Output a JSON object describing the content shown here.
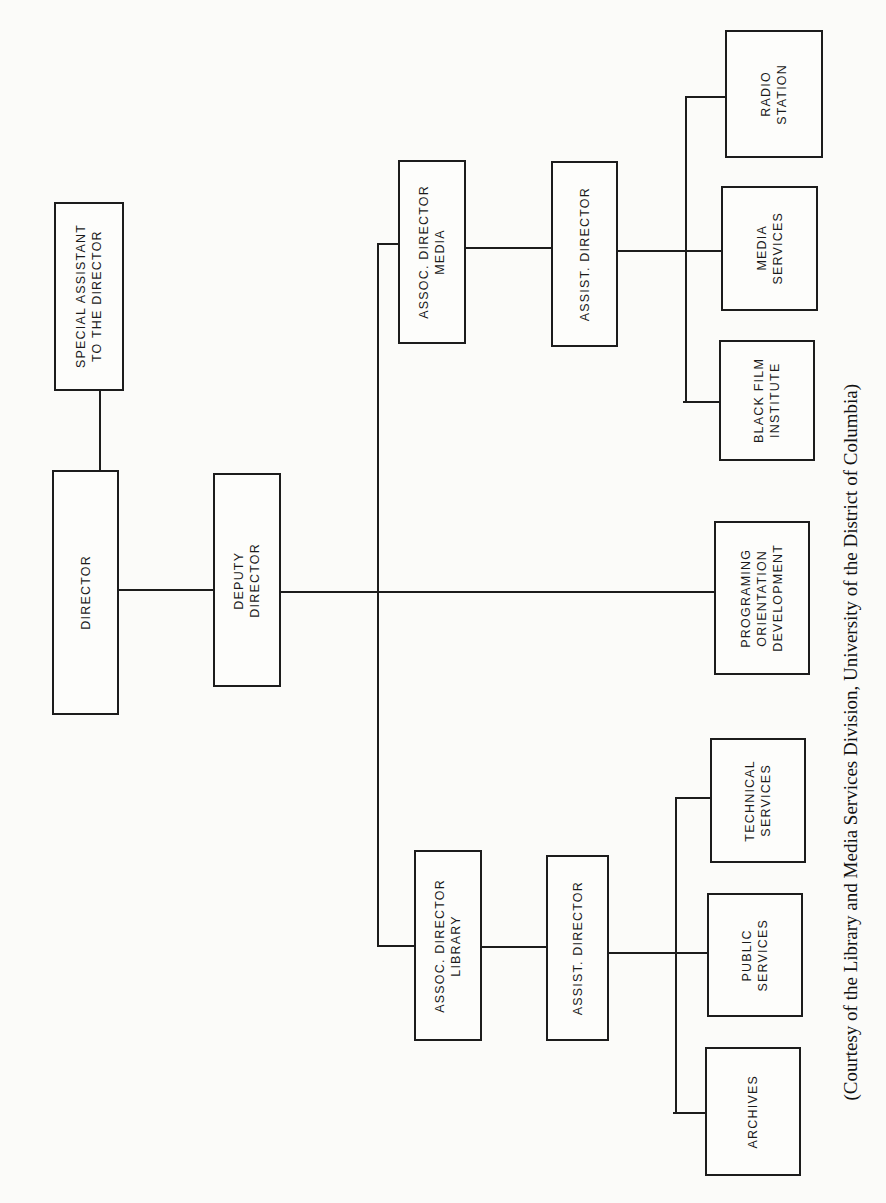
{
  "chart": {
    "orientation": "rotated 90 degrees counter-clockwise",
    "nodes": {
      "special_assistant": {
        "label": "SPECIAL ASSISTANT\nTO THE DIRECTOR"
      },
      "director": {
        "label": "DIRECTOR"
      },
      "deputy_director": {
        "label": "DEPUTY\nDIRECTOR"
      },
      "assoc_director_media": {
        "label": "ASSOC. DIRECTOR\nMEDIA"
      },
      "assist_director_media": {
        "label": "ASSIST. DIRECTOR"
      },
      "radio_station": {
        "label": "RADIO\nSTATION"
      },
      "media_services": {
        "label": "MEDIA\nSERVICES"
      },
      "black_film_institute": {
        "label": "BLACK FILM\nINSTITUTE"
      },
      "programing": {
        "label": "PROGRAMING\nORIENTATION\nDEVELOPMENT"
      },
      "assoc_director_library": {
        "label": "ASSOC. DIRECTOR\nLIBRARY"
      },
      "assist_director_library": {
        "label": "ASSIST. DIRECTOR"
      },
      "technical_services": {
        "label": "TECHNICAL\nSERVICES"
      },
      "public_services": {
        "label": "PUBLIC\nSERVICES"
      },
      "archives": {
        "label": "ARCHIVES"
      }
    },
    "edges": [
      [
        "director",
        "special_assistant"
      ],
      [
        "director",
        "deputy_director"
      ],
      [
        "deputy_director",
        "assoc_director_media"
      ],
      [
        "deputy_director",
        "programing"
      ],
      [
        "deputy_director",
        "assoc_director_library"
      ],
      [
        "assoc_director_media",
        "assist_director_media"
      ],
      [
        "assist_director_media",
        "radio_station"
      ],
      [
        "assist_director_media",
        "media_services"
      ],
      [
        "assist_director_media",
        "black_film_institute"
      ],
      [
        "assoc_director_library",
        "assist_director_library"
      ],
      [
        "assist_director_library",
        "technical_services"
      ],
      [
        "assist_director_library",
        "public_services"
      ],
      [
        "assist_director_library",
        "archives"
      ]
    ]
  },
  "caption": "(Courtesy of the Library and Media Services Division, University of the District of Columbia)"
}
